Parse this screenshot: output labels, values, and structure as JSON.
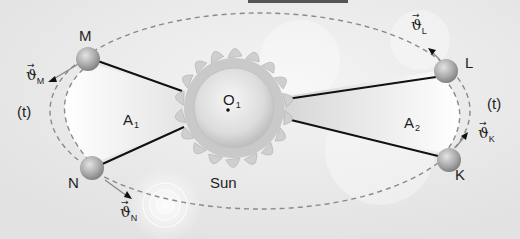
{
  "diagram": {
    "type": "Kepler second law (equal areas) illustration",
    "colors": {
      "background": "#e9e9e9",
      "orbit_dash": "#8a8a8a",
      "radius_line": "#111111",
      "swept_area": "#ffffff",
      "planet": "#9a9a9a",
      "sun": "#d8d8d8",
      "top_bar": "#555555"
    },
    "sun": {
      "label": "Sun",
      "center_label": "O",
      "center_subscript": "1"
    },
    "planets": [
      {
        "id": "M",
        "label": "M",
        "velocity_symbol": "ϑ",
        "velocity_subscript": "M"
      },
      {
        "id": "N",
        "label": "N",
        "velocity_symbol": "ϑ",
        "velocity_subscript": "N"
      },
      {
        "id": "L",
        "label": "L",
        "velocity_symbol": "ϑ",
        "velocity_subscript": "L"
      },
      {
        "id": "K",
        "label": "K",
        "velocity_symbol": "ϑ",
        "velocity_subscript": "K"
      }
    ],
    "areas": [
      {
        "label": "A",
        "subscript": "1"
      },
      {
        "label": "A",
        "subscript": "2"
      }
    ],
    "time_labels": {
      "left": "(t)",
      "right": "(t)"
    },
    "vector_arrow": "→"
  }
}
